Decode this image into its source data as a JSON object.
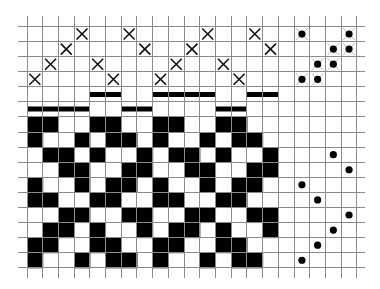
{
  "diagram": {
    "type": "weaving-draft",
    "colors": {
      "background": "#ffffff",
      "grid": "#8a8a8a",
      "ink": "#000000"
    },
    "grid": {
      "origin_x": 27,
      "origin_y": 26.5,
      "cell_w": 15.71,
      "cell_h": 15.08,
      "cols": 21,
      "rows": 16,
      "stub_left": 9,
      "stub_right": 8,
      "stub_top": 11,
      "stub_bottom": 10
    },
    "threading": {
      "label": "threading",
      "first_row": 0,
      "shafts": 4,
      "marks": [
        {
          "col": 0,
          "row": 3
        },
        {
          "col": 1,
          "row": 2
        },
        {
          "col": 2,
          "row": 1
        },
        {
          "col": 3,
          "row": 0
        },
        {
          "col": 4,
          "row": 2
        },
        {
          "col": 5,
          "row": 3
        },
        {
          "col": 6,
          "row": 0
        },
        {
          "col": 7,
          "row": 1
        },
        {
          "col": 8,
          "row": 3
        },
        {
          "col": 9,
          "row": 2
        },
        {
          "col": 10,
          "row": 1
        },
        {
          "col": 11,
          "row": 0
        },
        {
          "col": 12,
          "row": 2
        },
        {
          "col": 13,
          "row": 3
        },
        {
          "col": 14,
          "row": 0
        },
        {
          "col": 15,
          "row": 1
        }
      ]
    },
    "tieup": {
      "label": "tie-up",
      "first_col": 17,
      "marks": [
        {
          "col": 0,
          "row": 0
        },
        {
          "col": 3,
          "row": 0
        },
        {
          "col": 2,
          "row": 1
        },
        {
          "col": 3,
          "row": 1
        },
        {
          "col": 1,
          "row": 2
        },
        {
          "col": 2,
          "row": 2
        },
        {
          "col": 0,
          "row": 3
        },
        {
          "col": 1,
          "row": 3
        }
      ]
    },
    "color_bars": {
      "upper": {
        "y_top": 92,
        "height": 5,
        "spans": [
          [
            4,
            5
          ],
          [
            8,
            11
          ],
          [
            14,
            15
          ]
        ]
      },
      "lower": {
        "y_top": 106.5,
        "height": 5,
        "spans": [
          [
            0,
            3
          ],
          [
            6,
            7
          ],
          [
            12,
            13
          ]
        ]
      }
    },
    "treadling": {
      "label": "treadling",
      "first_row": 6,
      "first_col": 17,
      "marks": [
        {
          "row": 2,
          "col": 2
        },
        {
          "row": 3,
          "col": 3
        },
        {
          "row": 4,
          "col": 0
        },
        {
          "row": 5,
          "col": 1
        },
        {
          "row": 6,
          "col": 3
        },
        {
          "row": 7,
          "col": 2
        },
        {
          "row": 8,
          "col": 1
        },
        {
          "row": 9,
          "col": 0
        }
      ]
    },
    "drawdown": {
      "label": "drawdown",
      "first_row": 6,
      "first_col": 0,
      "rows": [
        "1100110011001100",
        "1001011010010110",
        "0110100101101001",
        "0011001100110011",
        "1001011010010110",
        "1100110011001100",
        "0011001100110011",
        "0110100101101001",
        "1100110011001100",
        "1001011010010110"
      ]
    }
  }
}
